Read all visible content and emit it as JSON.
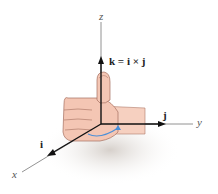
{
  "diagram": {
    "axes": {
      "x": "x",
      "y": "y",
      "z": "z"
    },
    "vectors": {
      "i": "i",
      "j": "j",
      "k_equation": "k = i × j"
    },
    "colors": {
      "axis": "#666666",
      "vector": "#1a1a1a",
      "skin": "#f4c6b4",
      "skin_shadow": "#d9998a",
      "curl_arrow": "#4a8fd8",
      "shadow": "#d8d2cc"
    }
  }
}
